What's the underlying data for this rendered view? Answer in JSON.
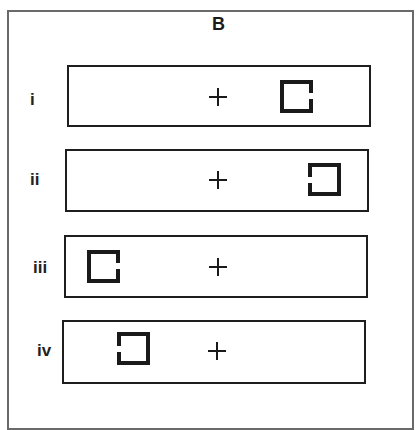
{
  "figure": {
    "title": "B",
    "colors": {
      "frame": "#6a6a6a",
      "panel_border": "#1e1e1e",
      "ink": "#1a1a1a",
      "background": "#ffffff"
    },
    "rows": [
      {
        "label": "i",
        "fixation": "cross",
        "stimulus": {
          "shape": "square",
          "gap_side": "right",
          "position": "right"
        }
      },
      {
        "label": "ii",
        "fixation": "cross",
        "stimulus": {
          "shape": "square",
          "gap_side": "left",
          "position": "right"
        }
      },
      {
        "label": "iii",
        "fixation": "cross",
        "stimulus": {
          "shape": "square",
          "gap_side": "right",
          "position": "left"
        }
      },
      {
        "label": "iv",
        "fixation": "cross",
        "stimulus": {
          "shape": "square",
          "gap_side": "left",
          "position": "left"
        }
      }
    ]
  }
}
